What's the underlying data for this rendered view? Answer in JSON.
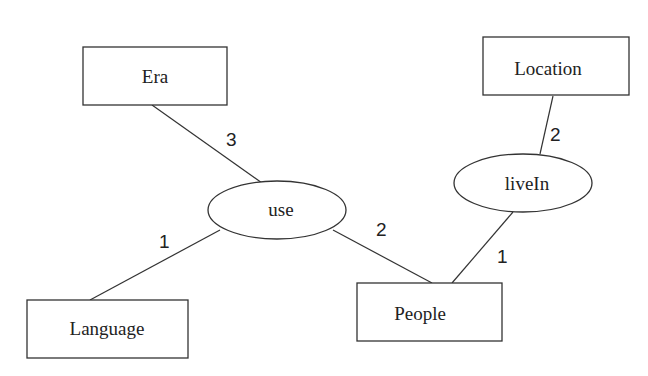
{
  "diagram": {
    "type": "entity-relationship",
    "entities": [
      {
        "id": "era",
        "label": "Era"
      },
      {
        "id": "language",
        "label": "Language"
      },
      {
        "id": "people",
        "label": "People"
      },
      {
        "id": "location",
        "label": "Location"
      }
    ],
    "relationships": [
      {
        "id": "use",
        "label": "use"
      },
      {
        "id": "livein",
        "label": "liveIn"
      }
    ],
    "edges": [
      {
        "from": "era",
        "to": "use",
        "cardinality": "3"
      },
      {
        "from": "language",
        "to": "use",
        "cardinality": "1"
      },
      {
        "from": "people",
        "to": "use",
        "cardinality": "2"
      },
      {
        "from": "location",
        "to": "livein",
        "cardinality": "2"
      },
      {
        "from": "people",
        "to": "livein",
        "cardinality": "1"
      }
    ]
  }
}
